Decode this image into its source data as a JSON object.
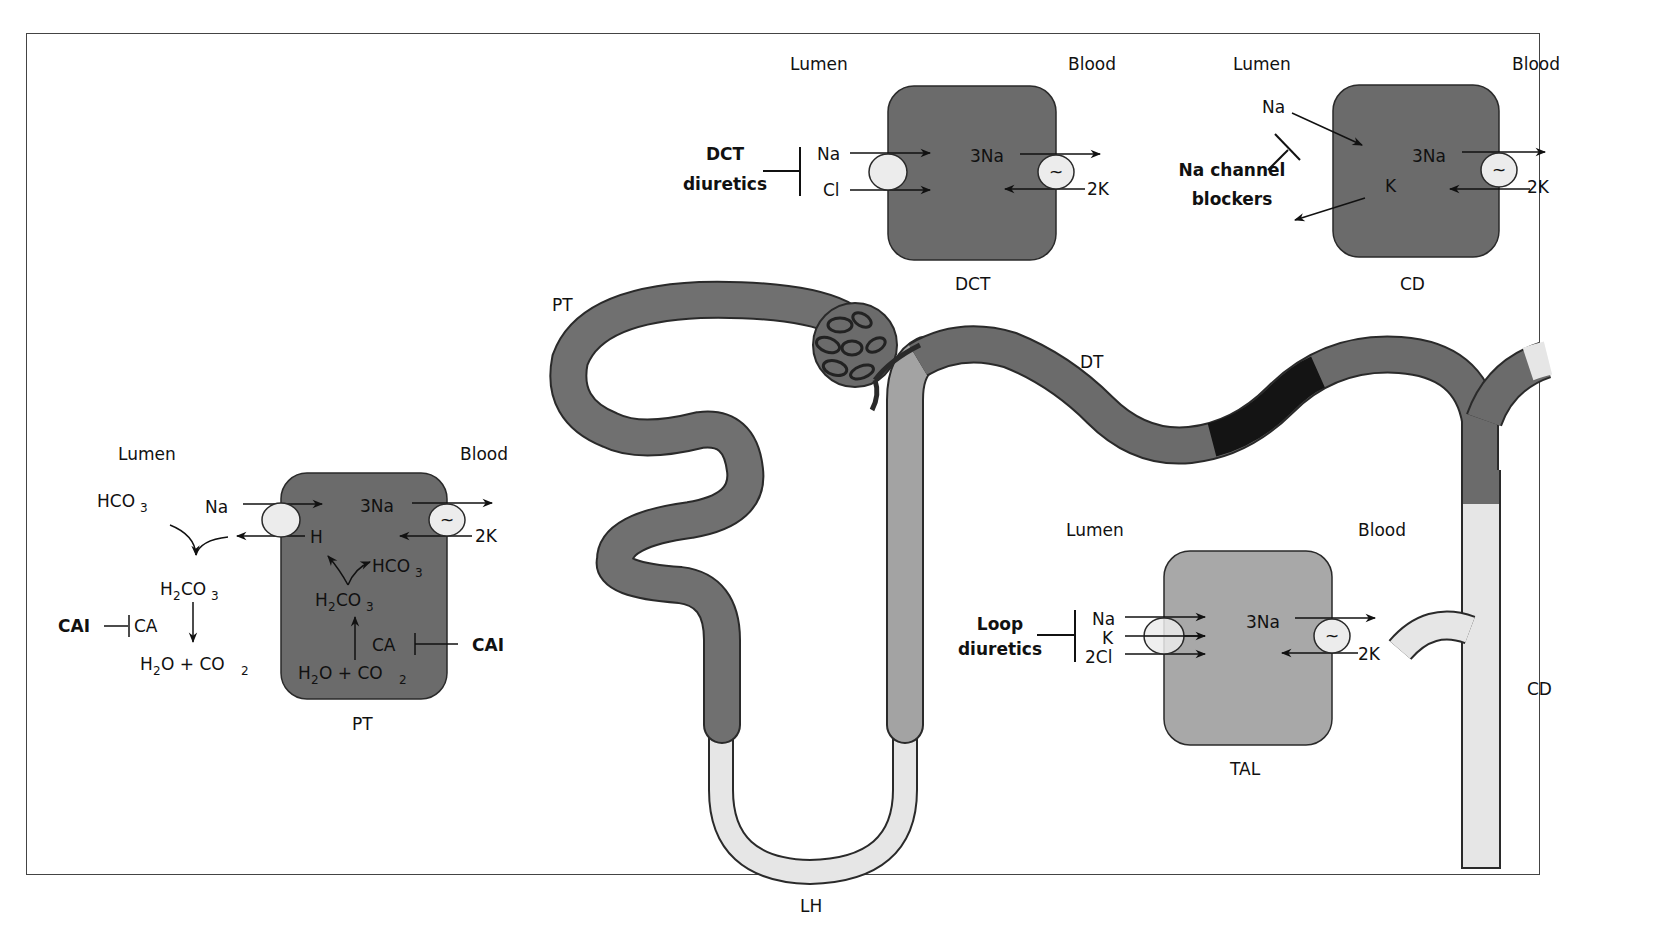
{
  "colors": {
    "dark_cell": "#6b6b6b",
    "medium_cell": "#a8a8a8",
    "light_tubule": "#e6e6e6",
    "black_segment": "#141414",
    "tubule_dark": "#707070",
    "tubule_medium": "#a3a3a3",
    "outline": "#2a2a2a",
    "transporter": "#ececec"
  },
  "nephron_labels": {
    "pt": "PT",
    "dt": "DT",
    "lh": "LH",
    "cd": "CD"
  },
  "dct_panel": {
    "lumen": "Lumen",
    "blood": "Blood",
    "drug_line1": "DCT",
    "drug_line2": "diuretics",
    "na": "Na",
    "cl": "Cl",
    "pump_na": "3Na",
    "pump_k": "2K",
    "pump_symbol": "~",
    "cell_label": "DCT"
  },
  "cd_panel": {
    "lumen": "Lumen",
    "blood": "Blood",
    "drug_line1": "Na channel",
    "drug_line2": "blockers",
    "na": "Na",
    "k": "K",
    "pump_na": "3Na",
    "pump_k": "2K",
    "pump_symbol": "~",
    "cell_label": "CD"
  },
  "pt_panel": {
    "lumen": "Lumen",
    "blood": "Blood",
    "hco3_lumen": "HCO",
    "hco3_sub": "3",
    "na": "Na",
    "h": "H",
    "pump_na": "3Na",
    "pump_k": "2K",
    "pump_symbol": "~",
    "h2co3_lumen_a": "H",
    "h2co3_lumen_b": "CO",
    "sub2": "2",
    "sub3": "3",
    "cai_left": "CAI",
    "ca_left": "CA",
    "h2o_co2_lumen_a": "H",
    "h2o_co2_lumen_b": "O + CO",
    "hco3_cell": "HCO",
    "h2co3_cell_a": "H",
    "h2co3_cell_b": "CO",
    "ca_right": "CA",
    "cai_right": "CAI",
    "h2o_co2_cell_a": "H",
    "h2o_co2_cell_b": "O + CO",
    "cell_label": "PT"
  },
  "tal_panel": {
    "lumen": "Lumen",
    "blood": "Blood",
    "drug_line1": "Loop",
    "drug_line2": "diuretics",
    "na": "Na",
    "k": "K",
    "cl": "2Cl",
    "pump_na": "3Na",
    "pump_k": "2K",
    "pump_symbol": "~",
    "cell_label": "TAL"
  }
}
